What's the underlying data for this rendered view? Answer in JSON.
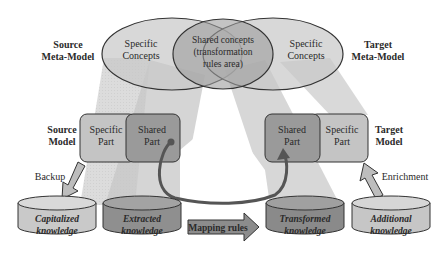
{
  "meta_models": {
    "source": {
      "line1": "Source",
      "line2": "Meta-Model",
      "specific_line1": "Specific",
      "specific_line2": "Concepts"
    },
    "target": {
      "line1": "Target",
      "line2": "Meta-Model",
      "specific_line1": "Specific",
      "specific_line2": "Concepts"
    },
    "shared": {
      "line1": "Shared concepts",
      "line2": "(transformation",
      "line3": "rules area)"
    }
  },
  "models": {
    "source": {
      "line1": "Source",
      "line2": "Model",
      "specific": {
        "line1": "Specific",
        "line2": "Part"
      },
      "shared": {
        "line1": "Shared",
        "line2": "Part"
      }
    },
    "target": {
      "line1": "Target",
      "line2": "Model",
      "specific": {
        "line1": "Specific",
        "line2": "Part"
      },
      "shared": {
        "line1": "Shared",
        "line2": "Part"
      }
    }
  },
  "arrows": {
    "backup": "Backup",
    "enrichment": "Enrichment",
    "mapping": "Mapping rules"
  },
  "databases": [
    {
      "line1": "Capitalized",
      "line2": "knowledge",
      "fill": "#c9c9c9"
    },
    {
      "line1": "Extracted",
      "line2": "knowledge",
      "fill": "#8f8f8f"
    },
    {
      "line1": "Transformed",
      "line2": "knowledge",
      "fill": "#8a8a8a"
    },
    {
      "line1": "Additional",
      "line2": "knowledge",
      "fill": "#c6c6c6"
    }
  ],
  "colors": {
    "light_fill": "#c4c4c4",
    "dark_fill": "#9a9a9a",
    "stroke": "#3a3a3a",
    "projection": "#d8d8d8"
  }
}
